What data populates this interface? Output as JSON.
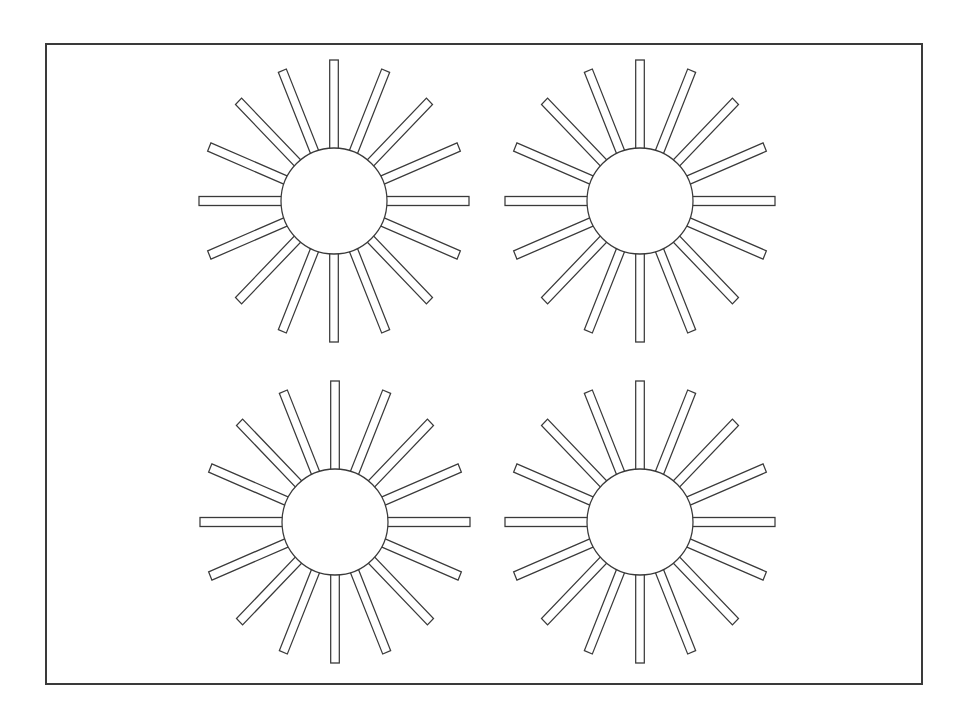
{
  "diagram": {
    "title": "",
    "frame": {
      "x": 45,
      "y": 43,
      "width": 878,
      "height": 642,
      "stroke": "#3a3a3a"
    },
    "sun_style": {
      "ray_count": 16,
      "ray_width": 9,
      "inner_radius": 53,
      "outer_radius_x": 135,
      "outer_radius_y": 141,
      "stroke": "#3a3a3a",
      "fill": "#ffffff"
    },
    "suns": [
      {
        "name": "sun-top-left",
        "cx": 334,
        "cy": 201
      },
      {
        "name": "sun-top-right",
        "cx": 640,
        "cy": 201
      },
      {
        "name": "sun-bottom-left",
        "cx": 335,
        "cy": 522
      },
      {
        "name": "sun-bottom-right",
        "cx": 640,
        "cy": 522
      }
    ]
  }
}
